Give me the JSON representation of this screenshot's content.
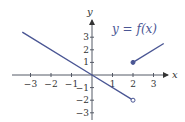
{
  "chart_data": {
    "type": "line",
    "title": "",
    "annotation": "y = f(x)",
    "xlabel": "x",
    "ylabel": "y",
    "xlim": [
      -3.9,
      3.8
    ],
    "ylim": [
      -3.4,
      3.9
    ],
    "xticks": [
      -3,
      -2,
      -1,
      1,
      2,
      3
    ],
    "yticks": [
      -3,
      -2,
      -1,
      1,
      2,
      3
    ],
    "xtick_labels": [
      "−3",
      "−2",
      "−1",
      "1",
      "2",
      "3"
    ],
    "ytick_labels": [
      "−3",
      "−2",
      "−1",
      "1",
      "2",
      "3"
    ],
    "grid": false,
    "legend": null,
    "series": [
      {
        "name": "f(x), x < 2",
        "points": [
          [
            -3.4,
            3.4
          ],
          [
            0,
            0
          ],
          [
            2,
            -2
          ]
        ],
        "formula": "y = -x",
        "end_marker": "open-circle"
      },
      {
        "name": "f(x), x >= 2",
        "points": [
          [
            2,
            1
          ],
          [
            3.5,
            2.5
          ]
        ],
        "formula": "y = x - 1",
        "start_marker": "filled-circle"
      }
    ],
    "line_color": "#4a5694"
  },
  "labels": {
    "x_axis": "x",
    "y_axis": "y",
    "function": "y = f(x)"
  }
}
